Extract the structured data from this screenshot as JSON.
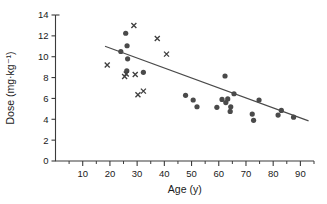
{
  "chart_data": {
    "type": "scatter",
    "title": "",
    "xlabel": "Age (y)",
    "ylabel": "Dose (mg·kg⁻¹)",
    "xlim": [
      0,
      95
    ],
    "ylim": [
      0,
      14
    ],
    "xticks": [
      10,
      20,
      30,
      40,
      50,
      60,
      70,
      80,
      90
    ],
    "yticks": [
      0,
      2,
      4,
      6,
      8,
      10,
      12,
      14
    ],
    "xtick_labels": [
      "10",
      "20",
      "30",
      "40",
      "50",
      "60",
      "70",
      "80",
      "90"
    ],
    "ytick_labels": [
      "0",
      "2",
      "4",
      "6",
      "8",
      "10",
      "12",
      "14"
    ],
    "minor_xticks": [
      5,
      15,
      25,
      35,
      45,
      55,
      65,
      75,
      85,
      95
    ],
    "grid": false,
    "legend": null,
    "series": [
      {
        "name": "circles",
        "marker": "circle",
        "color": "#4a4a4a",
        "points": [
          [
            24.0,
            10.5
          ],
          [
            25.8,
            12.25
          ],
          [
            26.3,
            11.05
          ],
          [
            26.5,
            9.8
          ],
          [
            26.2,
            8.65
          ],
          [
            32.3,
            8.5
          ],
          [
            47.8,
            6.3
          ],
          [
            50.6,
            5.85
          ],
          [
            52.0,
            5.2
          ],
          [
            59.3,
            5.15
          ],
          [
            61.2,
            5.9
          ],
          [
            62.3,
            8.15
          ],
          [
            62.6,
            5.6
          ],
          [
            63.3,
            5.95
          ],
          [
            64.2,
            4.75
          ],
          [
            64.4,
            5.2
          ],
          [
            65.6,
            6.45
          ],
          [
            72.3,
            4.5
          ],
          [
            72.8,
            3.9
          ],
          [
            74.8,
            5.85
          ],
          [
            81.8,
            4.4
          ],
          [
            83.0,
            4.85
          ],
          [
            87.5,
            4.2
          ]
        ]
      },
      {
        "name": "crosses",
        "marker": "x",
        "color": "#3f3f3f",
        "points": [
          [
            19.0,
            9.2
          ],
          [
            25.4,
            8.1
          ],
          [
            26.0,
            8.35
          ],
          [
            28.8,
            13.0
          ],
          [
            29.3,
            8.3
          ],
          [
            30.3,
            6.35
          ],
          [
            32.3,
            6.7
          ],
          [
            37.4,
            11.75
          ],
          [
            40.8,
            10.25
          ]
        ]
      }
    ],
    "fit_line": {
      "name": "regression-line",
      "x": [
        18.2,
        93.0
      ],
      "y": [
        11.0,
        3.85
      ],
      "color": "#4a4a4a"
    }
  }
}
